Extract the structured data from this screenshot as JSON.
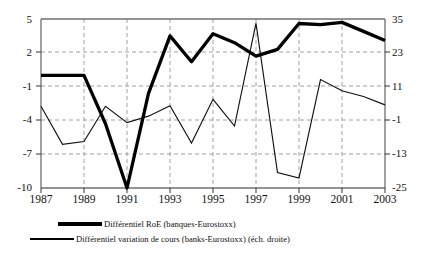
{
  "chart_data": {
    "type": "line",
    "title": "",
    "xlabel": "",
    "ylabel": "",
    "x": [
      1987,
      1988,
      1989,
      1990,
      1991,
      1992,
      1993,
      1994,
      1995,
      1996,
      1997,
      1998,
      1999,
      2000,
      2001,
      2002,
      2003
    ],
    "xticks": [
      "1987",
      "1989",
      "1991",
      "1993",
      "1995",
      "1997",
      "1999",
      "2001",
      "2003"
    ],
    "grid": true,
    "legend_position": "below",
    "left_axis": {
      "ticks": [
        5,
        2,
        -1,
        -4,
        -7,
        -10
      ],
      "ylim": [
        -10,
        5
      ],
      "tick_labels": [
        "5",
        "2",
        "-1",
        "-4",
        "-7",
        "-10"
      ]
    },
    "right_axis": {
      "ticks": [
        35,
        23,
        11,
        -1,
        -13,
        -25
      ],
      "ylim": [
        -25,
        35
      ],
      "tick_labels": [
        "35",
        "23",
        "11",
        "-1",
        "-13",
        "-25"
      ]
    },
    "series": [
      {
        "name": "Différentiel RoE (banques-Eurostoxx)",
        "axis": "left",
        "style": "thick",
        "values": [
          0.0,
          0.0,
          0.0,
          -4.3,
          -10.0,
          -1.6,
          3.5,
          1.2,
          3.7,
          2.9,
          1.7,
          2.3,
          4.6,
          4.5,
          4.7,
          3.9,
          3.1
        ]
      },
      {
        "name": "Différentiel variation de cours (banks-Eurostoxx) (éch. droite)",
        "axis": "right",
        "style": "thin",
        "values": [
          4.0,
          -9.5,
          -8.5,
          4.0,
          -1.8,
          0.5,
          4.2,
          -9.0,
          6.5,
          -3.0,
          33.5,
          -19.5,
          -21.5,
          13.5,
          9.5,
          7.5,
          4.5
        ]
      }
    ]
  },
  "legend": {
    "items": [
      {
        "label": "Différentiel RoE (banques-Eurostoxx)",
        "style": "thick"
      },
      {
        "label": "Différentiel variation de cours (banks-Eurostoxx) (éch. droite)",
        "style": "thin"
      }
    ]
  }
}
